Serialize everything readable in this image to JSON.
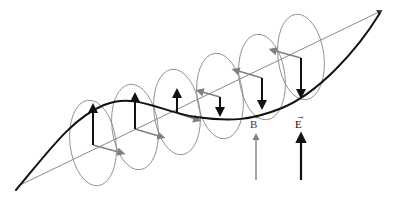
{
  "figure": {
    "background_color": "#ffffff",
    "width": 397,
    "height": 198
  },
  "colors": {
    "e_field": "#111111",
    "b_field": "#808080",
    "wave_curve": "#111111",
    "propagation_axis": "#8a8a8a",
    "ellipse_stroke": "#8c8c8c"
  },
  "legend": {
    "b_vector": {
      "symbol": "B",
      "overarrow": "→",
      "arrow_color": "#808080",
      "arrow_style": "thin",
      "direction": "up"
    },
    "e_vector": {
      "symbol": "E",
      "overarrow": "→",
      "arrow_color": "#111111",
      "arrow_style": "thick",
      "direction": "up"
    }
  },
  "axis": {
    "name": "propagation-axis",
    "x1": 18,
    "y1": 186,
    "x2": 381,
    "y2": 11,
    "has_arrowhead": true
  },
  "wave": {
    "name": "electric-field-wave",
    "path": "M 16,190 C 48,152 72,118 104,105 C 136,92 160,112 196,117 C 232,122 252,120 282,108 C 318,93 356,52 380,13",
    "stroke_width": 2
  },
  "ellipses": [
    {
      "cx": 93,
      "cy": 143,
      "rx": 23,
      "ry": 43,
      "rotation": -7
    },
    {
      "cx": 135,
      "cy": 127,
      "rx": 23,
      "ry": 43,
      "rotation": -7
    },
    {
      "cx": 177,
      "cy": 112,
      "rx": 23,
      "ry": 43,
      "rotation": -7
    },
    {
      "cx": 220,
      "cy": 96,
      "rx": 23,
      "ry": 43,
      "rotation": -7
    },
    {
      "cx": 262,
      "cy": 77,
      "rx": 23,
      "ry": 43,
      "rotation": -7
    },
    {
      "cx": 301,
      "cy": 57,
      "rx": 23,
      "ry": 43,
      "rotation": -7
    }
  ],
  "field_vectors": [
    {
      "index": 1,
      "e_from_y": 145,
      "e_to_y": 108,
      "b_to_x": 122,
      "b_to_y": 153,
      "base_x": 93,
      "base_y": 145
    },
    {
      "index": 2,
      "e_from_y": 129,
      "e_to_y": 97,
      "b_to_x": 160,
      "b_to_y": 136,
      "base_x": 135,
      "base_y": 129
    },
    {
      "index": 3,
      "e_from_y": 113,
      "e_to_y": 93,
      "b_to_x": 198,
      "b_to_y": 120,
      "base_x": 177,
      "base_y": 113
    },
    {
      "index": 4,
      "e_from_y": 97,
      "e_to_y": 111,
      "b_to_x": 198,
      "b_to_y": 91,
      "base_x": 220,
      "base_y": 97
    },
    {
      "index": 5,
      "e_from_y": 78,
      "e_to_y": 104,
      "b_to_x": 239,
      "b_to_y": 72,
      "base_x": 262,
      "base_y": 78
    },
    {
      "index": 6,
      "e_from_y": 58,
      "e_to_y": 93,
      "b_to_x": 277,
      "b_to_y": 52,
      "base_x": 301,
      "base_y": 58
    }
  ],
  "legend_arrows": {
    "b": {
      "x": 256,
      "y_top": 136,
      "y_bottom": 180
    },
    "e": {
      "x": 301,
      "y_top": 136,
      "y_bottom": 180
    }
  }
}
